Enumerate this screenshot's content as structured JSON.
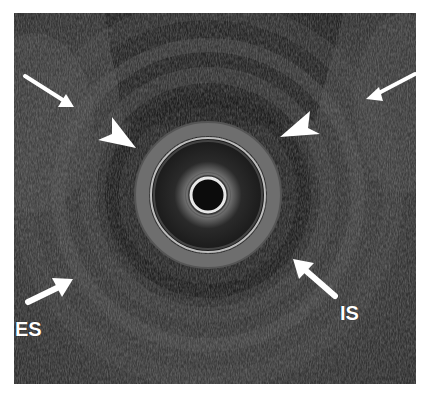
{
  "figure": {
    "colors": {
      "background": "#2a2a2a",
      "annotation": "#ffffff",
      "ring_bright": "#d8d8d8"
    }
  },
  "annotations": {
    "labels": [
      {
        "id": "es",
        "text": "ES"
      },
      {
        "id": "is",
        "text": "IS"
      }
    ],
    "arrows": [
      {
        "name": "thin-arrow-top-left",
        "type": "arrow"
      },
      {
        "name": "thin-arrow-top-right",
        "type": "arrow"
      },
      {
        "name": "arrowhead-left",
        "type": "arrowhead"
      },
      {
        "name": "arrowhead-right",
        "type": "arrowhead"
      },
      {
        "name": "es-arrow",
        "type": "thick-arrow"
      },
      {
        "name": "is-arrow",
        "type": "thick-arrow"
      }
    ]
  }
}
